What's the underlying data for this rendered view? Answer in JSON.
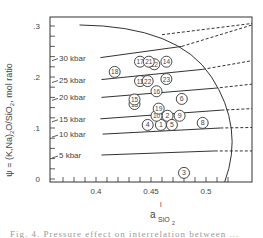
{
  "chart_data": {
    "type": "scatter",
    "title": "",
    "xlabel": "a^l SiO2",
    "xlabel_main": "a",
    "xlabel_sup": "l",
    "xlabel_sub": "SiO",
    "xlabel_sub2": "2",
    "ylabel": "ψ = (K,Na)2O/SiO2, mol ratio",
    "xlim": [
      0.365,
      0.535
    ],
    "ylim": [
      0,
      0.31
    ],
    "x_ticks": [
      {
        "value": 0.4,
        "label": "0.4"
      },
      {
        "value": 0.45,
        "label": "0.45"
      },
      {
        "value": 0.5,
        "label": "0.5"
      }
    ],
    "y_ticks": [
      {
        "value": 0,
        "label": "0"
      },
      {
        "value": 0.1,
        "label": ".1"
      },
      {
        "value": 0.2,
        "label": ".2"
      },
      {
        "value": 0.3,
        "label": ".3"
      }
    ],
    "grid": false,
    "isobars": [
      {
        "label": "5 kbar",
        "pressure_kbar": 5,
        "solid": [
          [
            0.405,
            0.047
          ],
          [
            0.508,
            0.055
          ]
        ],
        "dashed_to": [
          0.535,
          0.055
        ]
      },
      {
        "label": "10 kbar",
        "pressure_kbar": 10,
        "solid": [
          [
            0.406,
            0.088
          ],
          [
            0.513,
            0.1
          ]
        ],
        "dashed_to": [
          0.535,
          0.101
        ]
      },
      {
        "label": "15 kbar",
        "pressure_kbar": 15,
        "solid": [
          [
            0.404,
            0.118
          ],
          [
            0.514,
            0.135
          ]
        ],
        "dashed_to": [
          0.535,
          0.138
        ]
      },
      {
        "label": "20 kbar",
        "pressure_kbar": 20,
        "solid": [
          [
            0.405,
            0.16
          ],
          [
            0.508,
            0.178
          ]
        ],
        "dashed_to": [
          0.535,
          0.186
        ]
      },
      {
        "label": "25 kbar",
        "pressure_kbar": 25,
        "solid": [
          [
            0.405,
            0.195
          ],
          [
            0.497,
            0.215
          ]
        ],
        "dashed_to": [
          0.535,
          0.232
        ]
      },
      {
        "label": "30 kbar",
        "pressure_kbar": 30,
        "solid": [
          [
            0.404,
            0.238
          ],
          [
            0.478,
            0.26
          ]
        ],
        "dashed_to": [
          0.535,
          0.302
        ]
      }
    ],
    "boundary_curve": "solid curve from upper-left (~0.39, 0.30) descending to (~0.517, 0)",
    "top_dashed": "dashed line from (~0.46, 0.285) to (0.535, 0.305)",
    "points": [
      {
        "id": "1",
        "x": 0.459,
        "y": 0.106
      },
      {
        "id": "2",
        "x": 0.465,
        "y": 0.124
      },
      {
        "id": "3",
        "x": 0.48,
        "y": 0.012
      },
      {
        "id": "4",
        "x": 0.447,
        "y": 0.106
      },
      {
        "id": "5",
        "x": 0.469,
        "y": 0.106
      },
      {
        "id": "6",
        "x": 0.478,
        "y": 0.157
      },
      {
        "id": "8",
        "x": 0.497,
        "y": 0.11
      },
      {
        "id": "9",
        "x": 0.476,
        "y": 0.124
      },
      {
        "id": "10",
        "x": 0.455,
        "y": 0.124
      },
      {
        "id": "11",
        "x": 0.44,
        "y": 0.192
      },
      {
        "id": "12",
        "x": 0.453,
        "y": 0.225
      },
      {
        "id": "13",
        "x": 0.435,
        "y": 0.147
      },
      {
        "id": "14",
        "x": 0.464,
        "y": 0.23
      },
      {
        "id": "15",
        "x": 0.435,
        "y": 0.156
      },
      {
        "id": "16",
        "x": 0.455,
        "y": 0.172
      },
      {
        "id": "17",
        "x": 0.44,
        "y": 0.23
      },
      {
        "id": "18",
        "x": 0.417,
        "y": 0.21
      },
      {
        "id": "19",
        "x": 0.457,
        "y": 0.138
      },
      {
        "id": "21",
        "x": 0.448,
        "y": 0.23
      },
      {
        "id": "22",
        "x": 0.447,
        "y": 0.192
      },
      {
        "id": "23",
        "x": 0.464,
        "y": 0.196
      }
    ]
  },
  "caption": "Fig. 4. Pressure effect on interrelation between ..."
}
